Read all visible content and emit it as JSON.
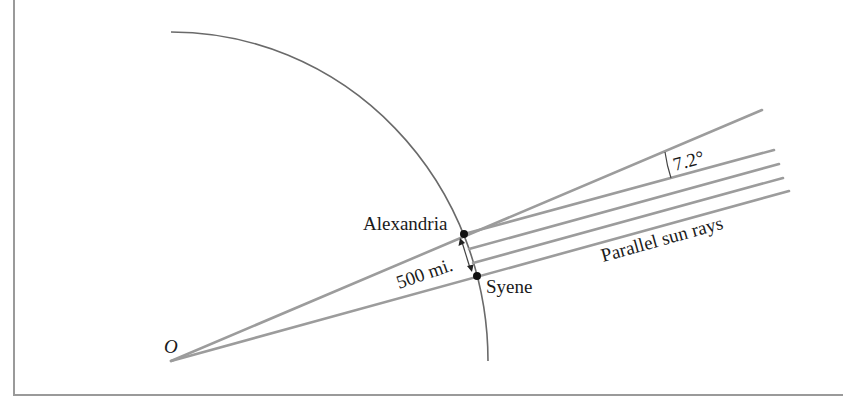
{
  "diagram": {
    "labels": {
      "center": "O",
      "city_north": "Alexandria",
      "city_south": "Syene",
      "distance": "500 mi.",
      "angle": "7.2°",
      "rays": "Parallel sun rays"
    },
    "colors": {
      "ray": "#9c9c9c",
      "earth_arc": "#6a6a6a",
      "text": "#1a1a1a",
      "border": "#9a9a9a"
    },
    "points": {
      "O": [
        171,
        361
      ],
      "Alexandria": [
        464,
        234
      ],
      "Syene": [
        477,
        276
      ]
    },
    "angle_degrees": 7.2,
    "distance_miles": 500
  }
}
